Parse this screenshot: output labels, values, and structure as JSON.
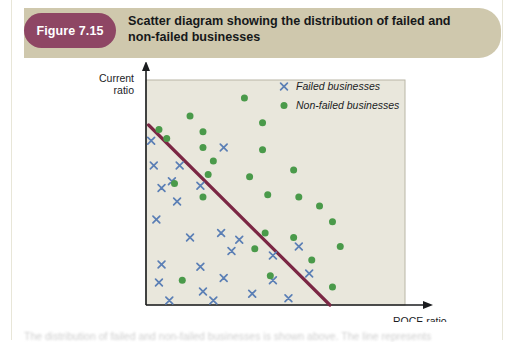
{
  "figure": {
    "badge_label": "Figure 7.15",
    "title": "Scatter diagram showing the distribution of failed and non-failed businesses",
    "badge_color": "#8e4664",
    "banner_color": "#cfc8ad"
  },
  "caption": {
    "text": "The distribution of failed and non-failed businesses is shown above. The line represents"
  },
  "chart_data": {
    "type": "scatter",
    "title": "Scatter diagram showing the distribution of failed and non-failed businesses",
    "xlabel": "ROCE ratio",
    "ylabel": "Current ratio",
    "grid": false,
    "axis_ticks": false,
    "xlim": [
      0,
      100
    ],
    "ylim": [
      0,
      100
    ],
    "plot_background": "#e9e7dc",
    "legend": {
      "position": "top-right",
      "entries": [
        {
          "name": "Failed businesses",
          "marker": "x",
          "color": "#5b7fb5"
        },
        {
          "name": "Non-failed businesses",
          "marker": "circle",
          "color": "#4a9a4a"
        }
      ]
    },
    "annotations": [
      {
        "name": "discriminant-line",
        "type": "line",
        "color": "#7b2744",
        "x0": 1,
        "y0": 80,
        "x1": 71,
        "y1": 0
      }
    ],
    "series": [
      {
        "name": "Failed businesses",
        "marker": "x",
        "color": "#5b7fb5",
        "points": [
          [
            2,
            73
          ],
          [
            3,
            62
          ],
          [
            13,
            62
          ],
          [
            30,
            70
          ],
          [
            10,
            55
          ],
          [
            6,
            52
          ],
          [
            21,
            53
          ],
          [
            12,
            46
          ],
          [
            4,
            38
          ],
          [
            29,
            32
          ],
          [
            17,
            30
          ],
          [
            36,
            29
          ],
          [
            33,
            24
          ],
          [
            49,
            22
          ],
          [
            6,
            18
          ],
          [
            21,
            17
          ],
          [
            30,
            12
          ],
          [
            49,
            11
          ],
          [
            5,
            10
          ],
          [
            22,
            6
          ],
          [
            41,
            5
          ],
          [
            9,
            2
          ],
          [
            26,
            2
          ],
          [
            55,
            3
          ],
          [
            63,
            14
          ],
          [
            59,
            26
          ]
        ]
      },
      {
        "name": "Non-failed businesses",
        "marker": "circle",
        "color": "#4a9a4a",
        "points": [
          [
            38,
            92
          ],
          [
            17,
            84
          ],
          [
            5,
            78
          ],
          [
            22,
            77
          ],
          [
            45,
            81
          ],
          [
            8,
            74
          ],
          [
            22,
            70
          ],
          [
            26,
            64
          ],
          [
            45,
            69
          ],
          [
            24,
            58
          ],
          [
            11,
            54
          ],
          [
            22,
            48
          ],
          [
            40,
            57
          ],
          [
            57,
            60
          ],
          [
            47,
            49
          ],
          [
            59,
            48
          ],
          [
            67,
            44
          ],
          [
            72,
            37
          ],
          [
            46,
            32
          ],
          [
            57,
            30
          ],
          [
            42,
            25
          ],
          [
            75,
            26
          ],
          [
            64,
            20
          ],
          [
            48,
            13
          ],
          [
            72,
            8
          ],
          [
            14,
            11
          ]
        ]
      }
    ]
  }
}
